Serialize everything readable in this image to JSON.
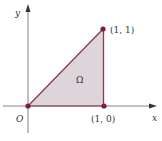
{
  "diagram": {
    "region_label": "Ω",
    "axes": {
      "x_label": "x",
      "y_label": "y",
      "origin_label": "O"
    },
    "points": [
      {
        "name": "origin",
        "label": "",
        "coords": [
          0,
          0
        ]
      },
      {
        "name": "p10",
        "label": "(1, 0)",
        "coords": [
          1,
          0
        ]
      },
      {
        "name": "p11",
        "label": "(1, 1)",
        "coords": [
          1,
          1
        ]
      }
    ],
    "colors": {
      "axis": "#777777",
      "edge": "#8a3a55",
      "fill": "#ddd5da",
      "point": "#7a1f3a",
      "text": "#333333"
    }
  }
}
